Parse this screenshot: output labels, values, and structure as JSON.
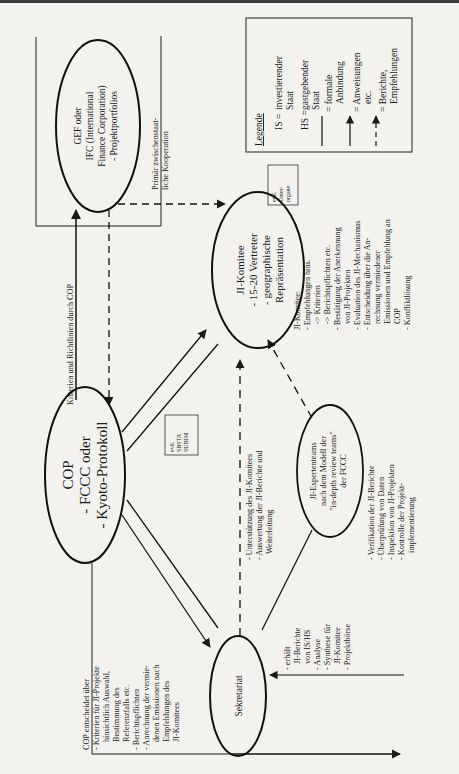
{
  "nodes": {
    "gef": {
      "lines": [
        "GEF oder",
        "IFC (International",
        "Finance Corporation)",
        "- Projektportfolios"
      ]
    },
    "cop": {
      "lines": [
        "COP",
        "- FCCC oder",
        "- Kyoto-Protokoll"
      ]
    },
    "ji_komitee": {
      "lines": [
        "JI-Komitee",
        "- 15-20 Vertreter",
        "- geographische",
        "Repräsentation"
      ]
    },
    "sekretariat": {
      "lines": [
        "Sekretariat"
      ]
    },
    "ji_experten": {
      "lines": [
        "JI-Expertenteams",
        "nach dem Modell der",
        "\"in-depth review teams\"",
        "der FCCC"
      ]
    }
  },
  "boxes": {
    "sbsta": {
      "lines": [
        "evtl.",
        "SBSTA",
        "SUBIM"
      ]
    },
    "unterorgane": {
      "lines": [
        "evtl.",
        "Unter-",
        "organe"
      ]
    }
  },
  "labels": {
    "gef_frame": [
      "Primär zwischenstaat-",
      "liche Kooperation"
    ],
    "kriterien": "Kriterien und Richtlinien durch COP",
    "cop_entscheidet": [
      "COP entscheidet über",
      "- Kriterien für JI-Projekte",
      "  hinsichtlich Auswahl,",
      "  Bestimmung des",
      "  Referenzfalls etc.",
      "- Berichtspflichten",
      "- Anrechnung der vermie-",
      "  denen Emissionen nach",
      "  Empfehlungen des",
      "  JI-Komitees"
    ],
    "unterstuetzung": [
      "- Unterstützung des JI-Komitees",
      "- Auswertung der JI-Berichte und",
      "  Weiterleitung"
    ],
    "sekretariat_tasks": [
      "- erhält",
      "  JI-Berichte",
      "  von IS/HS",
      "- Analyse",
      "- Synthese für",
      "  JI-Komitee",
      "- Projektbörse"
    ],
    "experten_tasks": [
      "- Verifikation der JI-Berichte",
      "- Überprüfung von Daten",
      "- Inspektion von JI-Projekten",
      "- Kontrolle der Projekt-",
      "  implementierung"
    ],
    "komitee_tasks": [
      "JI-Komitee:",
      "- Empfehlungen hins.",
      "   -> Kriterien",
      "   -> Berichtspflichten etc.",
      "- Bestätigung der Anerkennung",
      "  von JI-Projekten",
      "- Evaluation des JI-Mechanismus",
      "- Entscheidung über die An-",
      "  rechnung vermiedener",
      "  Emissionen und Empfehlung an",
      "  COP",
      "- Konfliktlösung"
    ]
  },
  "legend": {
    "title": "Legende",
    "items": [
      {
        "symbol": "IS =",
        "text": [
          "investierender",
          "Staat"
        ]
      },
      {
        "symbol": "HS =",
        "text": [
          "gastgebender",
          "Staat"
        ]
      },
      {
        "symbol": "solid-line",
        "text": [
          "= formale",
          "Anbindung"
        ]
      },
      {
        "symbol": "solid-arrow",
        "text": [
          "= Anweisungen",
          "etc."
        ]
      },
      {
        "symbol": "dashed-arrow",
        "text": [
          "= Berichte,",
          "Empfehlungen"
        ]
      }
    ]
  },
  "colors": {
    "ink": "#1a1a1a",
    "paper": "#f3f2ee"
  }
}
